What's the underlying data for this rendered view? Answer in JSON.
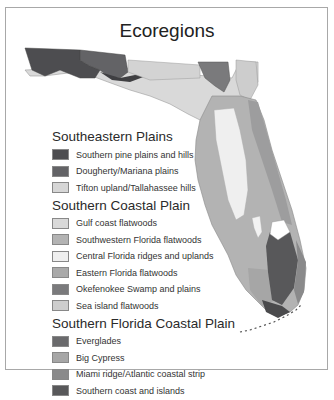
{
  "title": "Ecoregions",
  "legend": {
    "groups": [
      {
        "title": "Southeastern Plains",
        "items": [
          {
            "label": "Southern pine plains and hills",
            "color": "#4d4d50"
          },
          {
            "label": "Dougherty/Mariana plains",
            "color": "#636366"
          },
          {
            "label": "Tifton upland/Tallahassee hills",
            "color": "#d6d6d6"
          }
        ]
      },
      {
        "title": "Southern Coastal Plain",
        "items": [
          {
            "label": "Gulf coast flatwoods",
            "color": "#d9d9d9"
          },
          {
            "label": "Southwestern Florida flatwoods",
            "color": "#b3b3b3"
          },
          {
            "label": "Central Florida ridges and uplands",
            "color": "#efefef"
          },
          {
            "label": "Eastern Florida flatwoods",
            "color": "#a9a9a9"
          },
          {
            "label": "Okefenokee Swamp and plains",
            "color": "#7a7a7c"
          },
          {
            "label": "Sea island flatwoods",
            "color": "#cdcdcd"
          }
        ]
      },
      {
        "title": "Southern Florida Coastal Plain",
        "items": [
          {
            "label": "Everglades",
            "color": "#6a6a6c"
          },
          {
            "label": "Big Cypress",
            "color": "#a6a6a6"
          },
          {
            "label": "Miami ridge/Atlantic coastal strip",
            "color": "#8a8a8b"
          },
          {
            "label": "Southern coast and islands",
            "color": "#58585a"
          }
        ]
      }
    ]
  }
}
